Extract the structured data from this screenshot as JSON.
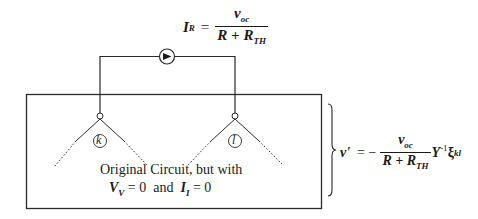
{
  "equations": {
    "top": {
      "lhs": "I",
      "lhs_sub": "R",
      "equals": "=",
      "num_var": "v",
      "num_sub": "oc",
      "den_R": "R + R",
      "den_sub": "TH"
    },
    "right": {
      "lhs": "v'",
      "equals": "= −",
      "num_var": "v",
      "num_sub": "oc",
      "den_R": "R + R",
      "den_sub": "TH",
      "matrix": "Y",
      "matrix_sup": "-1",
      "vec": "ξ",
      "vec_sub": "kl"
    }
  },
  "nodes": {
    "k": {
      "label": "k"
    },
    "l": {
      "label": "l"
    }
  },
  "box_caption": {
    "line1": "Original Circuit, but with",
    "v_var": "V",
    "v_sub": "V",
    "v_eq": " = 0  and  ",
    "i_var": "I",
    "i_sub": "I",
    "i_eq": " = 0"
  },
  "current_source": {
    "icon": "current-source-arrow-icon",
    "direction": "right"
  }
}
